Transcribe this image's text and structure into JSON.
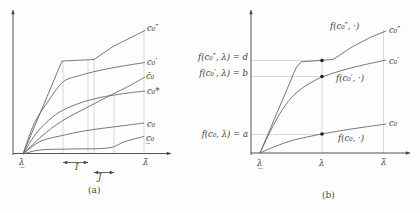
{
  "figure": {
    "colors": {
      "background": "#fdfdfd",
      "curve": "#606060",
      "axis": "#3f3f3f",
      "guide": "#c8c8c8",
      "dot": "#1f1f1f",
      "text": "#3b3b3b"
    }
  },
  "panel_a": {
    "labels": {
      "curve_c0_dprime": "c₀″",
      "curve_c0_prime": "c₀′",
      "curve_c0_bar": "c̄₀",
      "curve_c0_star": "c₀*",
      "curve_c0": "c₀",
      "curve_c0_under": "c̲₀",
      "x_lambda_under": "λ̲",
      "x_lambda_bar": "λ̄",
      "interval_I": "I",
      "interval_J": "J",
      "caption": "(a)"
    }
  },
  "panel_b": {
    "labels": {
      "y_d": "f(c₀″, λ) = d",
      "y_b": "f(c₀′, λ) = b",
      "y_a": "f(c₀, λ) = a",
      "ann_c0_dprime": "f(c₀″, ·)",
      "ann_c0_prime": "f(c₀′, ·)",
      "ann_c0": "f(c₀, ·)",
      "curve_c0_dprime": "c₀″",
      "curve_c0_prime": "c₀′",
      "curve_c0": "c₀",
      "x_lambda_under": "λ̲",
      "x_lambda": "λ",
      "x_lambda_bar": "λ̄",
      "caption": "(b)"
    }
  },
  "chart_data": [
    {
      "type": "line",
      "name": "panel-a",
      "title": "",
      "xlabel": "λ (qualitative axis from λ̲ to λ̄, no numeric ticks)",
      "ylabel": "",
      "x_axis_ticks": [
        "λ̲",
        "λ̄"
      ],
      "axis": {
        "x": [
          13,
          153.5,
          171,
          153.5
        ],
        "y": [
          13,
          155,
          13,
          10
        ]
      },
      "curves": [
        {
          "name": "c0-doubleprime",
          "label": "c₀″",
          "mode": "linear",
          "points": [
            [
              23,
              154
            ],
            [
              62,
              61
            ],
            [
              94,
              59.5
            ],
            [
              113,
              46.5
            ],
            [
              130,
              38
            ],
            [
              145,
              30.5
            ]
          ]
        },
        {
          "name": "c0-prime",
          "label": "c₀′",
          "mode": "smooth",
          "points": [
            [
              23,
              154
            ],
            [
              34,
              124
            ],
            [
              47,
              103
            ],
            [
              63,
              82
            ],
            [
              80,
              75.5
            ],
            [
              97,
              71
            ],
            [
              120,
              66.5
            ],
            [
              145,
              62.5
            ]
          ]
        },
        {
          "name": "c0-bar",
          "label": "c̄₀",
          "mode": "smooth",
          "points": [
            [
              23,
              154
            ],
            [
              42,
              136
            ],
            [
              62,
              121
            ],
            [
              88,
              107
            ],
            [
              111,
              95
            ],
            [
              129,
              86
            ],
            [
              145,
              77
            ]
          ]
        },
        {
          "name": "c0-star",
          "label": "c₀*",
          "mode": "smooth",
          "points": [
            [
              23,
              154
            ],
            [
              38,
              131
            ],
            [
              58,
              113
            ],
            [
              80,
              103
            ],
            [
              98,
              98
            ],
            [
              111,
              95.5
            ],
            [
              128,
              93
            ],
            [
              145,
              91
            ]
          ]
        },
        {
          "name": "c0",
          "label": "c₀",
          "mode": "smooth",
          "points": [
            [
              23,
              154
            ],
            [
              40,
              141.5
            ],
            [
              60,
              136
            ],
            [
              87,
              130.5
            ],
            [
              117,
              126.5
            ],
            [
              144,
              123
            ]
          ]
        },
        {
          "name": "c0-underline",
          "label": "c̲₀",
          "mode": "smooth",
          "points": [
            [
              23,
              154
            ],
            [
              40,
              150
            ],
            [
              70,
              149
            ],
            [
              108,
              148
            ],
            [
              125,
              141.5
            ],
            [
              144,
              136.5
            ]
          ]
        }
      ],
      "guides": [
        [
          63,
          61,
          63,
          153
        ],
        [
          88,
          59,
          88,
          153
        ],
        [
          94,
          58,
          94,
          153
        ],
        [
          114,
          95,
          114,
          153
        ],
        [
          144,
          28,
          144,
          153
        ]
      ],
      "interval_arrows": [
        {
          "label": "I",
          "x1": 63,
          "x2": 88,
          "y": 162.5
        },
        {
          "label": "J",
          "x1": 94,
          "x2": 114,
          "y": 172.5
        }
      ]
    },
    {
      "type": "line",
      "name": "panel-b",
      "title": "",
      "xlabel": "λ (qualitative axis: λ̲, λ, λ̄)",
      "ylabel": "f values a, b, d marked on y-axis",
      "x_axis_ticks": [
        "λ̲",
        "λ",
        "λ̄"
      ],
      "axis": {
        "x": [
          251,
          153,
          410,
          153
        ],
        "y": [
          251,
          155,
          251,
          10
        ]
      },
      "curves": [
        {
          "name": "c0-doubleprime",
          "label": "c₀″",
          "mode": "linear",
          "points": [
            [
              260,
              153
            ],
            [
              296,
              68
            ],
            [
              301,
              61.8
            ],
            [
              333,
              59.5
            ],
            [
              352,
              47
            ],
            [
              370,
              37.5
            ],
            [
              386,
              31
            ]
          ]
        },
        {
          "name": "c0-prime",
          "label": "c₀′",
          "mode": "smooth",
          "points": [
            [
              260,
              153
            ],
            [
              269,
              134
            ],
            [
              279,
              115
            ],
            [
              291,
              98
            ],
            [
              303,
              87.5
            ],
            [
              313,
              81.5
            ],
            [
              322,
              77
            ],
            [
              340,
              71
            ],
            [
              361,
              65.5
            ],
            [
              386,
              60
            ]
          ]
        },
        {
          "name": "c0",
          "label": "c₀",
          "mode": "smooth",
          "points": [
            [
              260,
              153
            ],
            [
              275,
              146.5
            ],
            [
              292,
              140.5
            ],
            [
              308,
              136.8
            ],
            [
              322,
              134
            ],
            [
              345,
              130
            ],
            [
              365,
              127
            ],
            [
              386,
              124
            ]
          ]
        }
      ],
      "guides": [
        [
          251,
          60.5,
          322,
          60.5
        ],
        [
          251,
          76.5,
          322,
          76.5
        ],
        [
          251,
          134.5,
          322,
          134.5
        ],
        [
          322,
          58,
          322,
          153
        ],
        [
          383.5,
          30,
          383.5,
          153
        ]
      ],
      "dots": [
        [
          322,
          60.5
        ],
        [
          322,
          76.5
        ],
        [
          322,
          134
        ]
      ]
    }
  ]
}
